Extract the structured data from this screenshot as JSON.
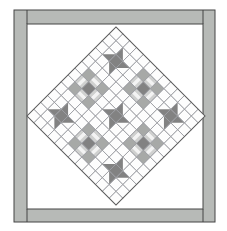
{
  "canvas": {
    "width": 227,
    "height": 231,
    "background": "#ffffff"
  },
  "frame": {
    "x": 14,
    "y": 10,
    "width": 201,
    "height": 212,
    "fill": "#b7bab7",
    "stroke": "#454545",
    "inner": {
      "x": 27,
      "y": 24,
      "width": 176,
      "height": 185,
      "fill": "#ffffff"
    }
  },
  "quilt": {
    "center_x": 116,
    "center_y": 116,
    "rotation_deg": 45,
    "grid": 13,
    "cell_size": 9.685,
    "palette": {
      "white": "#fdfdfd",
      "dark": "#828282",
      "medium": "#a7a9a7",
      "light": "#cfd0cf",
      "strip_white": "#f3f3f3",
      "grid_line": "#9a9ba0",
      "outline": "#5f5f5f"
    },
    "blocks": [
      {
        "type": "friendship-star",
        "col": 1,
        "row": 1,
        "position": "top"
      },
      {
        "type": "friendship-star",
        "col": 9,
        "row": 1,
        "position": "right"
      },
      {
        "type": "friendship-star",
        "col": 1,
        "row": 9,
        "position": "left"
      },
      {
        "type": "friendship-star",
        "col": 9,
        "row": 9,
        "position": "bottom"
      },
      {
        "type": "friendship-star",
        "col": 5,
        "row": 5,
        "position": "center"
      },
      {
        "type": "chain",
        "col": 5,
        "row": 1,
        "position": "upper-right"
      },
      {
        "type": "chain",
        "col": 1,
        "row": 5,
        "position": "upper-left"
      },
      {
        "type": "chain",
        "col": 9,
        "row": 5,
        "position": "lower-right"
      },
      {
        "type": "chain",
        "col": 5,
        "row": 9,
        "position": "lower-left"
      }
    ]
  }
}
